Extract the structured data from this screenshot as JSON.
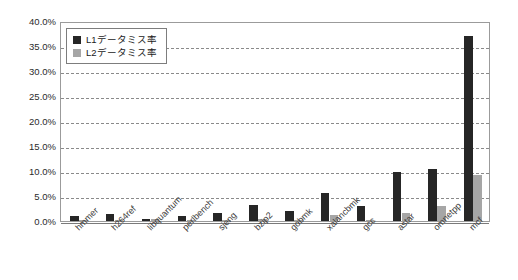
{
  "chart_data": {
    "type": "bar",
    "title": "",
    "subtitle": "",
    "xlabel": "",
    "ylabel": "",
    "ylim": [
      0,
      40
    ],
    "ytick_labels": [
      "0.0%",
      "5.0%",
      "10.0%",
      "15.0%",
      "20.0%",
      "25.0%",
      "30.0%",
      "35.0%",
      "40.0%"
    ],
    "ytick_values": [
      0,
      5,
      10,
      15,
      20,
      25,
      30,
      35,
      40
    ],
    "grid": true,
    "grid_axis": "y",
    "grid_style": "dashed",
    "legend_position": "top-left-inside",
    "categories": [
      "hmmer",
      "h264ref",
      "libquantum",
      "perlbench",
      "sjeng",
      "bzip2",
      "gobmk",
      "xalancbmk",
      "gcc",
      "astar",
      "omnetpp",
      "mcf"
    ],
    "series": [
      {
        "name": "L1データミス率",
        "color": "#262626",
        "values": [
          1.1,
          1.5,
          0.4,
          1.1,
          1.7,
          3.3,
          2.1,
          5.6,
          3.1,
          9.8,
          10.5,
          37.0
        ]
      },
      {
        "name": "L2データミス率",
        "color": "#a6a6a6",
        "values": [
          0.05,
          0.1,
          0.35,
          0.05,
          0.05,
          0.5,
          0.1,
          1.2,
          0.3,
          1.7,
          3.1,
          9.3
        ]
      }
    ],
    "annotations": []
  },
  "legend": {
    "items": [
      {
        "label": "L1データミス率",
        "swatch": "l1"
      },
      {
        "label": "L2データミス率",
        "swatch": "l2"
      }
    ]
  }
}
